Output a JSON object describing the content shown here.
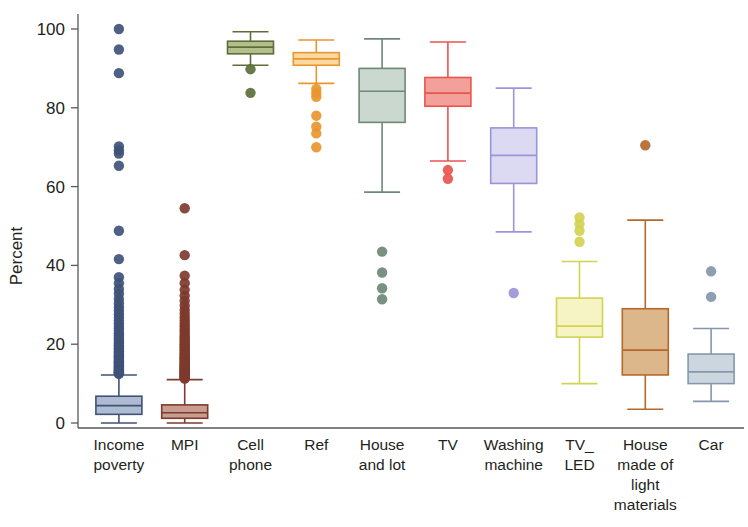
{
  "chart_data": {
    "type": "box",
    "title": "",
    "xlabel": "",
    "ylabel": "Percent",
    "ylim": [
      -3,
      103
    ],
    "yticks": [
      0,
      20,
      40,
      60,
      80,
      100
    ],
    "ytick_labels": [
      "0",
      "20",
      "40",
      "60",
      "80",
      "100"
    ],
    "grid": false,
    "legend": "none",
    "categories": [
      "Income poverty",
      "MPI",
      "Cell phone",
      "Ref",
      "House and lot",
      "TV",
      "Washing machine",
      "TV_LED",
      "House made of light materials",
      "Car"
    ],
    "category_label_lines": [
      [
        "Income",
        "poverty"
      ],
      [
        "MPI"
      ],
      [
        "Cell",
        "phone"
      ],
      [
        "Ref"
      ],
      [
        "House",
        "and lot"
      ],
      [
        "TV"
      ],
      [
        "Washing",
        "machine"
      ],
      [
        "TV_",
        "LED"
      ],
      [
        "House",
        "made of",
        "light",
        "materials"
      ],
      [
        "Car"
      ]
    ],
    "boxes": [
      {
        "name": "Income poverty",
        "color": "#3f5278",
        "fill": "#aebcd2",
        "whisker_low": 0.0,
        "q1": 2.2,
        "median": 4.4,
        "q3": 6.8,
        "whisker_high": 12.2,
        "outliers": [
          100.0,
          94.8,
          88.8,
          70.2,
          69.2,
          68.4,
          65.3,
          48.8,
          41.6,
          37.0,
          35.5,
          34.0,
          32.8,
          31.5,
          30.4,
          29.4,
          28.5,
          27.6,
          26.8,
          26.0,
          25.3,
          24.6,
          24.0,
          23.4,
          22.8,
          22.2,
          21.7,
          21.2,
          20.7,
          20.2,
          19.8,
          19.4,
          19.0,
          18.6,
          18.2,
          17.9,
          17.5,
          17.2,
          16.9,
          16.6,
          16.3,
          16.0,
          15.7,
          15.4,
          15.2,
          14.9,
          14.7,
          14.4,
          14.2,
          14.0,
          13.8,
          13.6,
          13.4,
          13.2,
          13.0,
          12.9,
          12.7,
          12.6,
          12.5
        ]
      },
      {
        "name": "MPI",
        "color": "#7e3a2e",
        "fill": "#c79d90",
        "whisker_low": 0.0,
        "q1": 1.2,
        "median": 2.6,
        "q3": 4.6,
        "whisker_high": 11.0,
        "outliers": [
          54.5,
          42.6,
          37.4,
          35.5,
          33.8,
          32.3,
          31.0,
          29.8,
          28.7,
          27.7,
          26.8,
          26.0,
          25.2,
          24.5,
          23.8,
          23.2,
          22.6,
          22.0,
          21.5,
          21.0,
          20.5,
          20.0,
          19.6,
          19.2,
          18.8,
          18.4,
          18.0,
          17.6,
          17.3,
          17.0,
          16.7,
          16.4,
          16.1,
          15.8,
          15.5,
          15.3,
          15.0,
          14.8,
          14.5,
          14.3,
          14.1,
          13.9,
          13.7,
          13.5,
          13.3,
          13.1,
          12.9,
          12.7,
          12.5,
          12.4,
          12.2,
          12.0,
          11.9,
          11.7,
          11.6,
          11.4,
          11.3
        ]
      },
      {
        "name": "Cell phone",
        "color": "#5c6f3a",
        "fill": "#b4c08c",
        "whisker_low": 90.8,
        "q1": 93.7,
        "median": 95.4,
        "q3": 96.9,
        "whisker_high": 99.3,
        "outliers": [
          89.8,
          83.8
        ]
      },
      {
        "name": "Ref",
        "color": "#e8962e",
        "fill": "#fbd9a0",
        "whisker_low": 86.2,
        "q1": 90.8,
        "median": 92.4,
        "q3": 94.0,
        "whisker_high": 97.2,
        "outliers": [
          84.8,
          83.8,
          82.8,
          78.0,
          75.2,
          73.5,
          70.0
        ]
      },
      {
        "name": "House and lot",
        "color": "#6e8878",
        "fill": "#cbd8cf",
        "whisker_low": 58.6,
        "q1": 76.3,
        "median": 84.2,
        "q3": 90.0,
        "whisker_high": 97.5,
        "outliers": [
          43.5,
          38.2,
          34.2,
          31.4
        ]
      },
      {
        "name": "TV",
        "color": "#e8554e",
        "fill": "#f4a09a",
        "whisker_low": 66.5,
        "q1": 80.4,
        "median": 83.7,
        "q3": 87.7,
        "whisker_high": 96.7,
        "outliers": [
          64.2,
          62.0
        ]
      },
      {
        "name": "Washing machine",
        "color": "#9a95d8",
        "fill": "#dcd9f2",
        "whisker_low": 48.5,
        "q1": 60.8,
        "median": 67.9,
        "q3": 74.9,
        "whisker_high": 85.0,
        "outliers": [
          33.0
        ]
      },
      {
        "name": "TV_LED",
        "color": "#d4d253",
        "fill": "#f6f4c4",
        "whisker_low": 10.0,
        "q1": 21.8,
        "median": 24.6,
        "q3": 31.7,
        "whisker_high": 41.0,
        "outliers": [
          52.2,
          50.5,
          48.8,
          46.0
        ]
      },
      {
        "name": "House made of light materials",
        "color": "#b5682a",
        "fill": "#ddb78c",
        "whisker_low": 3.5,
        "q1": 12.2,
        "median": 18.5,
        "q3": 29.0,
        "whisker_high": 51.5,
        "outliers": [
          70.5
        ]
      },
      {
        "name": "Car",
        "color": "#8497ad",
        "fill": "#ccd6df",
        "whisker_low": 5.5,
        "q1": 10.0,
        "median": 13.0,
        "q3": 17.5,
        "whisker_high": 24.0,
        "outliers": [
          38.5,
          32.0
        ]
      }
    ]
  },
  "axes": {
    "y_axis_title": "Percent"
  }
}
